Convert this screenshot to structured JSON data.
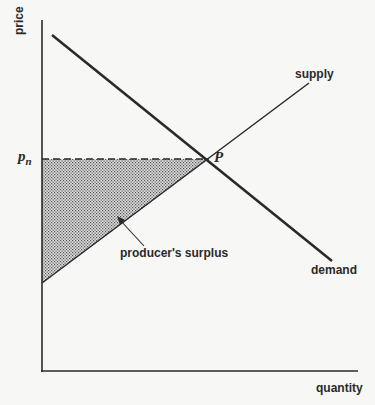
{
  "axes": {
    "y_label": "price",
    "x_label": "quantity"
  },
  "curves": {
    "supply_label": "supply",
    "demand_label": "demand"
  },
  "equilibrium": {
    "point_label": "P",
    "price_label_base": "p",
    "price_label_sub": "n"
  },
  "region": {
    "label": "producer's surplus"
  },
  "colors": {
    "ink": "#2a2a2a",
    "background": "#f7f7f5",
    "shading": "#9a9a9a"
  },
  "geometry": {
    "origin": [
      42,
      371
    ],
    "y_axis_top": [
      42,
      20
    ],
    "x_axis_end": [
      358,
      371
    ],
    "demand": [
      [
        52,
        35
      ],
      [
        332,
        261
      ]
    ],
    "supply": [
      [
        42,
        283
      ],
      [
        309,
        83
      ]
    ],
    "equilibrium_point": [
      209,
      159
    ]
  }
}
